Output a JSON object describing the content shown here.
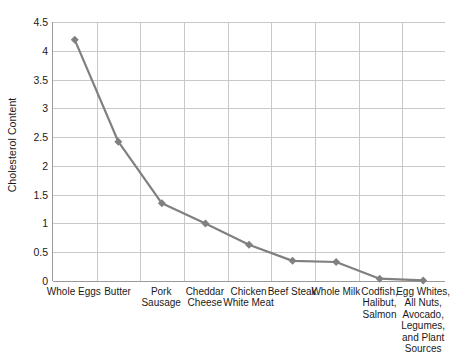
{
  "chart_data": {
    "type": "line",
    "title": "",
    "xlabel": "",
    "ylabel": "Cholesterol Content",
    "ylim": [
      0,
      4.5
    ],
    "yticks": [
      "0",
      "0.5",
      "1",
      "1.5",
      "2",
      "2.5",
      "3",
      "3.5",
      "4",
      "4.5"
    ],
    "ytick_values": [
      0,
      0.5,
      1,
      1.5,
      2,
      2.5,
      3,
      3.5,
      4,
      4.5
    ],
    "grid": true,
    "legend": "none",
    "marker": "diamond",
    "series_color": "#808080",
    "grid_color": "#c8c8c8",
    "axis_color": "#9a9a9a",
    "categories": [
      "Whole Eggs",
      "Butter",
      "Pork Sausage",
      "Cheddar Cheese",
      "Chicken White Meat",
      "Beef Steak",
      "Whole Milk",
      "Codfish, Halibut, Salmon",
      "Egg Whites, All Nuts, Avocado, Legumes, and Plant Sources"
    ],
    "values": [
      4.19,
      2.42,
      1.35,
      1.0,
      0.63,
      0.35,
      0.33,
      0.04,
      0.01
    ]
  }
}
